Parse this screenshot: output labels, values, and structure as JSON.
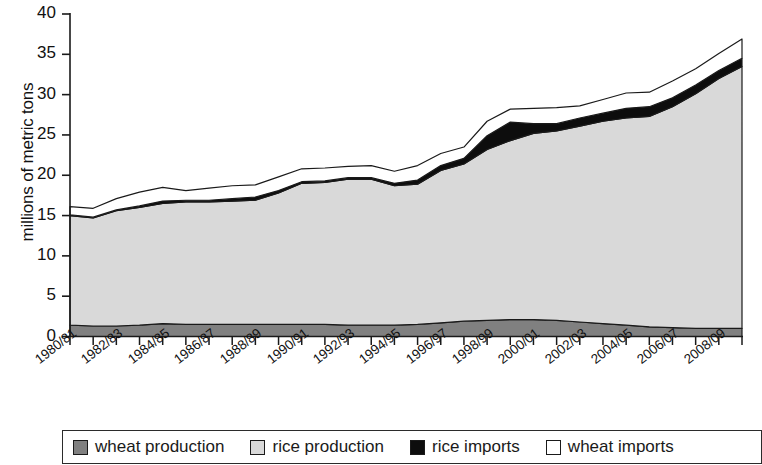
{
  "chart_data": {
    "type": "area",
    "stacked": true,
    "title": "",
    "xlabel": "",
    "ylabel": "millions of metric tons",
    "ylim": [
      0,
      40
    ],
    "yticks": [
      0,
      5,
      10,
      15,
      20,
      25,
      30,
      35,
      40
    ],
    "grid": false,
    "legend_position": "bottom",
    "x": [
      "1980/81",
      "1981/82",
      "1982/83",
      "1983/84",
      "1984/85",
      "1985/86",
      "1986/87",
      "1987/88",
      "1988/89",
      "1989/90",
      "1990/91",
      "1991/92",
      "1992/93",
      "1993/94",
      "1994/95",
      "1995/96",
      "1996/97",
      "1997/98",
      "1998/99",
      "1999/00",
      "2000/01",
      "2001/02",
      "2002/03",
      "2003/04",
      "2004/05",
      "2005/06",
      "2006/07",
      "2007/08",
      "2008/09",
      "2009/10"
    ],
    "xtick_labels": [
      "1980/81",
      "1982/83",
      "1984/85",
      "1986/87",
      "1988/89",
      "1990/91",
      "1992/93",
      "1994/95",
      "1996/97",
      "1998/99",
      "2000/01",
      "2002/03",
      "2004/05",
      "2006/07",
      "2008/09"
    ],
    "series": [
      {
        "name": "wheat production",
        "color": "#808080",
        "values": [
          1.4,
          1.3,
          1.3,
          1.4,
          1.6,
          1.5,
          1.5,
          1.5,
          1.5,
          1.5,
          1.5,
          1.5,
          1.4,
          1.4,
          1.4,
          1.5,
          1.7,
          1.9,
          2.0,
          2.1,
          2.1,
          2.0,
          1.8,
          1.6,
          1.4,
          1.2,
          1.1,
          1.0,
          1.0,
          1.0
        ]
      },
      {
        "name": "rice production",
        "color": "#d9d9d9",
        "values": [
          13.6,
          13.4,
          14.3,
          14.6,
          14.9,
          15.2,
          15.2,
          15.3,
          15.4,
          16.3,
          17.5,
          17.6,
          18.1,
          18.1,
          17.3,
          17.4,
          18.9,
          19.5,
          21.2,
          22.2,
          23.1,
          23.5,
          24.3,
          25.1,
          25.7,
          26.1,
          27.4,
          29.1,
          31.0,
          32.5
        ]
      },
      {
        "name": "rice imports",
        "color": "#0d0d0d",
        "values": [
          0.1,
          0.1,
          0.1,
          0.2,
          0.3,
          0.2,
          0.2,
          0.3,
          0.4,
          0.3,
          0.2,
          0.2,
          0.2,
          0.2,
          0.3,
          0.5,
          0.6,
          0.7,
          1.7,
          2.3,
          1.2,
          0.9,
          1.0,
          1.0,
          1.2,
          1.2,
          1.1,
          1.1,
          1.0,
          1.0
        ]
      },
      {
        "name": "wheat imports",
        "color": "#ffffff",
        "values": [
          1.0,
          1.1,
          1.4,
          1.7,
          1.7,
          1.2,
          1.5,
          1.6,
          1.5,
          1.7,
          1.6,
          1.6,
          1.4,
          1.5,
          1.5,
          1.8,
          1.5,
          1.4,
          1.8,
          1.6,
          1.9,
          2.0,
          1.5,
          1.7,
          1.9,
          1.8,
          2.1,
          2.0,
          2.1,
          2.4
        ]
      }
    ]
  },
  "axis": {
    "y_label": "millions of metric tons",
    "y_ticks": [
      "0",
      "5",
      "10",
      "15",
      "20",
      "25",
      "30",
      "35",
      "40"
    ],
    "x_ticks": [
      "1980/81",
      "1982/83",
      "1984/85",
      "1986/87",
      "1988/89",
      "1990/91",
      "1992/93",
      "1994/95",
      "1996/97",
      "1998/99",
      "2000/01",
      "2002/03",
      "2004/05",
      "2006/07",
      "2008/09"
    ]
  },
  "legend": {
    "items": [
      {
        "label": "wheat production",
        "color": "#808080"
      },
      {
        "label": "rice production",
        "color": "#d9d9d9"
      },
      {
        "label": "rice imports",
        "color": "#0d0d0d"
      },
      {
        "label": "wheat imports",
        "color": "#ffffff"
      }
    ]
  }
}
